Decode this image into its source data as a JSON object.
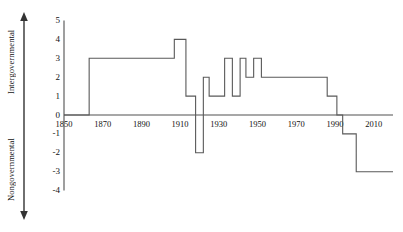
{
  "chart_data": {
    "type": "line",
    "title": "",
    "subtitle": "",
    "xlabel": "",
    "ylabel": "",
    "drawstyle": "steps-post",
    "grid": false,
    "legend": false,
    "legend_position": "none",
    "xlim": [
      1850,
      2020
    ],
    "ylim": [
      -4,
      5
    ],
    "xticks": [
      1850,
      1870,
      1890,
      1910,
      1930,
      1950,
      1970,
      1990,
      2010
    ],
    "xticklabels": [
      "1850",
      "1870",
      "1890",
      "1910",
      "1930",
      "1950",
      "1970",
      "1990",
      "2010"
    ],
    "yticks": [
      5,
      4,
      3,
      2,
      1,
      0,
      -1,
      -2,
      -3,
      -4
    ],
    "yticklabels": [
      "5",
      "4",
      "3",
      "2",
      "1",
      "0",
      "-1",
      "-2",
      "-3",
      "-4"
    ],
    "axis_direction_labels": {
      "positive": "Intergovernmental",
      "negative": "Nongovernmental"
    },
    "line_color": "#595959",
    "axis_color": "#404040",
    "series": [
      {
        "name": "organizational form",
        "x": [
          1850,
          1863,
          1907,
          1913,
          1915,
          1918,
          1922,
          1925,
          1933,
          1937,
          1941,
          1944,
          1948,
          1952,
          1956,
          1986,
          1991,
          1994,
          2001,
          2020
        ],
        "values": [
          0,
          3,
          4,
          1,
          1,
          -2,
          2,
          1,
          3,
          1,
          3,
          2,
          3,
          2,
          2,
          1,
          0,
          -1,
          -3,
          -3
        ]
      }
    ],
    "annotations": []
  },
  "figure": {
    "width": 403,
    "height": 232,
    "background": "#ffffff"
  }
}
